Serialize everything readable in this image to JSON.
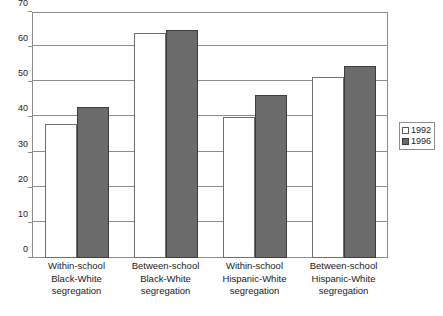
{
  "chart_data": {
    "type": "bar",
    "title": "",
    "subtitle": "",
    "xlabel": "",
    "ylabel": "",
    "ylim": [
      0,
      70
    ],
    "yticks": [
      0,
      10,
      20,
      30,
      40,
      50,
      60,
      70
    ],
    "ytick_labels": [
      "0",
      "10",
      "20",
      "30",
      "40",
      "50",
      "60",
      "70"
    ],
    "grid": true,
    "legend_position": "right",
    "categories": [
      "Within-school Black-White segregation",
      "Between-school Black-White segregation",
      "Within-school Hispanic-White segregation",
      "Between-school Hispanic-White segregation"
    ],
    "category_lines": [
      [
        "Within-school",
        "Black-White",
        "segregation"
      ],
      [
        "Between-school",
        "Black-White",
        "segregation"
      ],
      [
        "Within-school",
        "Hispanic-White",
        "segregation"
      ],
      [
        "Between-school",
        "Hispanic-White",
        "segregation"
      ]
    ],
    "series": [
      {
        "name": "1992",
        "color": "#ffffff",
        "border_color": "#6e6e6e",
        "values": [
          38,
          64,
          40,
          51.5
        ]
      },
      {
        "name": "1996",
        "color": "#6b6b6b",
        "border_color": "#3d3d3d",
        "values": [
          43,
          65,
          46.5,
          54.5
        ]
      }
    ]
  },
  "legend": {
    "entries": [
      {
        "label": "1992"
      },
      {
        "label": "1996"
      }
    ]
  },
  "colors": {
    "axis": "#8c8c8c",
    "grid": "#8c8c8c",
    "text": "#1a1a1a",
    "series_1992": "#ffffff",
    "series_1996": "#6b6b6b",
    "background": "#ffffff"
  }
}
